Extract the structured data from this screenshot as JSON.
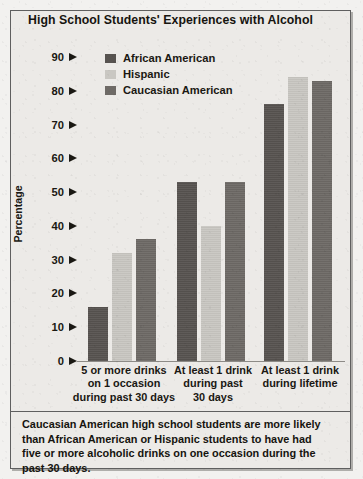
{
  "figure": {
    "title": "High School Students' Experiences with Alcohol",
    "caption": "Caucasian American high school students are more likely than African American or Hispanic students to have had five or more alcoholic drinks on one occasion during the past 30 days."
  },
  "colors": {
    "african_american": "#575350",
    "hispanic": "#c9c7c2",
    "caucasian_american": "#6e6a66",
    "paper": "#eceae7",
    "frame": "#5f5f5f",
    "text": "#1a1813"
  },
  "chart_data": {
    "type": "bar",
    "title": "High School Students' Experiences with Alcohol",
    "xlabel": "",
    "ylabel": "Percentage",
    "ylim": [
      0,
      90
    ],
    "yticks": [
      0,
      10,
      20,
      30,
      40,
      50,
      60,
      70,
      80,
      90
    ],
    "grid": false,
    "legend_position": "top-left-inside",
    "categories": [
      "5 or more drinks on 1 occasion during past 30 days",
      "At least 1 drink during past 30 days",
      "At least 1 drink during lifetime"
    ],
    "category_lines": [
      [
        "5 or more drinks",
        "on 1 occasion",
        "during past 30 days"
      ],
      [
        "At least 1 drink",
        "during past",
        "30 days"
      ],
      [
        "At least 1 drink",
        "during lifetime"
      ]
    ],
    "series": [
      {
        "name": "African American",
        "color": "#575350",
        "values": [
          16,
          53,
          76
        ]
      },
      {
        "name": "Hispanic",
        "color": "#c9c7c2",
        "values": [
          32,
          40,
          84
        ]
      },
      {
        "name": "Caucasian American",
        "color": "#6e6a66",
        "values": [
          36,
          53,
          83
        ]
      }
    ]
  }
}
